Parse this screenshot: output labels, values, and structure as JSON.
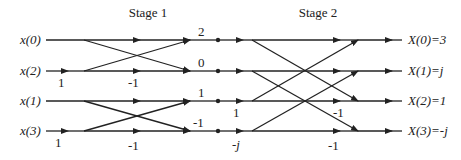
{
  "stages": [
    {
      "label": "Stage 1"
    },
    {
      "label": "Stage 2"
    }
  ],
  "inputs": [
    {
      "label": "x(0)"
    },
    {
      "label": "x(2)"
    },
    {
      "label": "x(1)"
    },
    {
      "label": "x(3)"
    }
  ],
  "outputs": [
    {
      "label": "X(0)=3"
    },
    {
      "label": "X(1)=j"
    },
    {
      "label": "X(2)=1"
    },
    {
      "label": "X(3)=-j"
    }
  ],
  "intermediate": [
    {
      "label": "2"
    },
    {
      "label": "0"
    },
    {
      "label": "1"
    },
    {
      "label": "-1"
    }
  ],
  "weights": {
    "stage1_input_twiddle_top": "1",
    "stage1_neg_top": "-1",
    "stage1_input_twiddle_bottom": "1",
    "stage1_neg_bottom": "-1",
    "stage2_twiddle_row3": "1",
    "stage2_twiddle_row4": "-j",
    "stage2_neg_row3": "-1",
    "stage2_neg_row4": "-1"
  }
}
